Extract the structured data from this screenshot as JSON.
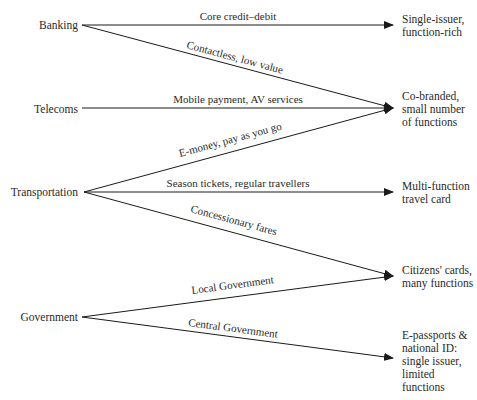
{
  "diagram": {
    "sources": [
      {
        "id": "banking",
        "label": "Banking"
      },
      {
        "id": "telecoms",
        "label": "Telecoms"
      },
      {
        "id": "transportation",
        "label": "Transportation"
      },
      {
        "id": "government",
        "label": "Government"
      }
    ],
    "targets": [
      {
        "id": "single-issuer",
        "lines": [
          "Single-issuer,",
          "function-rich"
        ]
      },
      {
        "id": "co-branded",
        "lines": [
          "Co-branded,",
          "small number",
          "of functions"
        ]
      },
      {
        "id": "multi-function",
        "lines": [
          "Multi-function",
          "travel card"
        ]
      },
      {
        "id": "citizens-cards",
        "lines": [
          "Citizens' cards,",
          "many functions"
        ]
      },
      {
        "id": "e-passports",
        "lines": [
          "E-passports &",
          "national ID:",
          "single issuer,",
          "limited",
          "functions"
        ]
      }
    ],
    "edges": [
      {
        "from": "banking",
        "to": "single-issuer",
        "label": "Core credit–debit"
      },
      {
        "from": "banking",
        "to": "co-branded",
        "label": "Contactless, low value"
      },
      {
        "from": "telecoms",
        "to": "co-branded",
        "label": "Mobile payment, AV services"
      },
      {
        "from": "transportation",
        "to": "co-branded",
        "label": "E-money, pay as you go"
      },
      {
        "from": "transportation",
        "to": "multi-function",
        "label": "Season tickets, regular travellers"
      },
      {
        "from": "transportation",
        "to": "citizens-cards",
        "label": "Concessionary fares"
      },
      {
        "from": "government",
        "to": "citizens-cards",
        "label": "Local Government"
      },
      {
        "from": "government",
        "to": "e-passports",
        "label": "Central Government"
      }
    ],
    "line_color": "#1a1a1a"
  }
}
